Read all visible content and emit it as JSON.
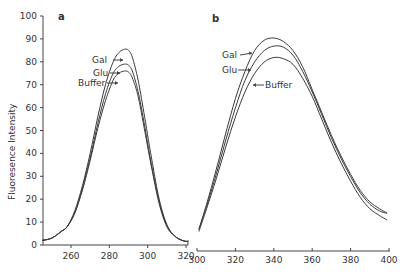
{
  "chart_data": [
    {
      "type": "line",
      "panel": "a",
      "title": "",
      "xlabel": "",
      "ylabel": "Fluoresence Intensity",
      "xlim": [
        245,
        322
      ],
      "ylim": [
        0,
        100
      ],
      "xticks": [
        260,
        280,
        300,
        320
      ],
      "yticks": [
        0,
        10,
        20,
        30,
        40,
        50,
        60,
        70,
        80,
        90,
        100
      ],
      "grid": false,
      "legend": "inline arrow annotations",
      "series": [
        {
          "name": "Gal",
          "x": [
            245,
            250,
            255,
            258,
            262,
            266,
            270,
            274,
            278,
            282,
            285,
            288,
            290,
            292,
            295,
            298,
            302,
            306,
            310,
            314,
            318,
            321
          ],
          "y": [
            2,
            3,
            6,
            8,
            15,
            26,
            40,
            56,
            70,
            80,
            84,
            85.5,
            85,
            82,
            72,
            58,
            38,
            20,
            9,
            4,
            2,
            1.5
          ]
        },
        {
          "name": "Glu",
          "x": [
            245,
            250,
            255,
            258,
            262,
            266,
            270,
            274,
            278,
            282,
            285,
            288,
            290,
            292,
            295,
            298,
            302,
            306,
            310,
            314,
            318,
            321
          ],
          "y": [
            2,
            3,
            6,
            8,
            14,
            25,
            38,
            53,
            66,
            75,
            78,
            79,
            78.5,
            76,
            67,
            54,
            35,
            19,
            8.5,
            4,
            2,
            1.5
          ]
        },
        {
          "name": "Buffer",
          "x": [
            245,
            250,
            255,
            258,
            262,
            266,
            270,
            274,
            278,
            282,
            285,
            288,
            290,
            292,
            295,
            298,
            302,
            306,
            310,
            314,
            318,
            321
          ],
          "y": [
            2,
            3,
            6,
            8,
            14,
            24,
            37,
            51,
            63,
            72,
            75,
            76,
            75.5,
            73,
            65,
            52,
            34,
            18,
            8,
            4,
            2,
            1.5
          ]
        }
      ],
      "annotations": [
        {
          "text": "Gal",
          "arrow_to": "Gal curve"
        },
        {
          "text": "Glu",
          "arrow_to": "Glu curve"
        },
        {
          "text": "Buffer",
          "arrow_to": "Buffer curve"
        }
      ]
    },
    {
      "type": "line",
      "panel": "b",
      "title": "",
      "xlabel": "",
      "ylabel": "",
      "xlim": [
        300,
        400
      ],
      "ylim": [
        0,
        100
      ],
      "xticks": [
        300,
        320,
        340,
        360,
        380,
        400
      ],
      "grid": false,
      "legend": "inline arrow annotations",
      "series": [
        {
          "name": "Gal",
          "x": [
            301,
            305,
            310,
            315,
            320,
            325,
            330,
            335,
            340,
            345,
            350,
            355,
            360,
            365,
            370,
            375,
            380,
            385,
            390,
            395,
            399
          ],
          "y": [
            6,
            17,
            32,
            48,
            63,
            75,
            84,
            88.5,
            89.5,
            88,
            84,
            77,
            67,
            57,
            47,
            38,
            30,
            23,
            18,
            15,
            13
          ]
        },
        {
          "name": "Glu",
          "x": [
            301,
            305,
            310,
            315,
            320,
            325,
            330,
            335,
            340,
            345,
            350,
            355,
            360,
            365,
            370,
            375,
            380,
            385,
            390,
            395,
            399
          ],
          "y": [
            6,
            16,
            30,
            45,
            59,
            71,
            79,
            84,
            86,
            85.5,
            82,
            75,
            66,
            56,
            46,
            37,
            29,
            22,
            17,
            14,
            13
          ]
        },
        {
          "name": "Buffer",
          "x": [
            301,
            305,
            310,
            315,
            320,
            325,
            330,
            335,
            340,
            345,
            350,
            355,
            360,
            365,
            370,
            375,
            380,
            385,
            390,
            395,
            399
          ],
          "y": [
            5,
            15,
            28,
            42,
            55,
            66,
            74,
            79,
            81,
            80.5,
            78,
            72,
            64,
            54,
            44,
            35,
            27,
            20,
            15,
            12,
            10
          ]
        }
      ],
      "annotations": [
        {
          "text": "Gal",
          "arrow_to": "Gal curve"
        },
        {
          "text": "Glu",
          "arrow_to": "Glu curve"
        },
        {
          "text": "Buffer",
          "arrow_to": "Buffer curve"
        }
      ]
    }
  ],
  "labels": {
    "panel_a": "a",
    "panel_b": "b",
    "ylabel": "Fluoresence Intensity",
    "gal": "Gal",
    "glu": "Glu",
    "buffer": "Buffer"
  }
}
